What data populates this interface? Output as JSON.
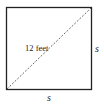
{
  "diagram": {
    "shape": "square",
    "diagonal_label": "12 feet",
    "side_right_label": "s",
    "side_bottom_label": "s",
    "stroke_color": "#222222"
  }
}
